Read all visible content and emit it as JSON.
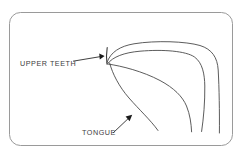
{
  "figure": {
    "background_color": "#ffffff",
    "frame": {
      "name": "rounded-rectangle-border",
      "stroke_color": "#9a9a9a",
      "fill_color": "#ffffff",
      "x": 9,
      "y": 12,
      "width": 224,
      "height": 134,
      "corner_radius": 11
    },
    "line_color": "#4a4a4a",
    "labels": [
      {
        "id": "upper-teeth",
        "text": "UPPER TEETH",
        "text_x": 20,
        "text_y": 66,
        "arrow": {
          "from_x": 73,
          "from_y": 61,
          "to_x": 104,
          "to_y": 56,
          "head_direction": "right"
        }
      },
      {
        "id": "tongue",
        "text": "TONGUE",
        "text_x": 82,
        "text_y": 135,
        "arrow": {
          "from_x": 113,
          "from_y": 133,
          "to_x": 132,
          "to_y": 115,
          "head_direction": "up-right"
        }
      }
    ],
    "strokes": [
      {
        "id": "upper-teeth-stroke",
        "name": "upper-teeth",
        "path": "M 107.2 47.5 C 106.4 52.5 106.3 58.5 107.0 64.2"
      },
      {
        "id": "hard-palate-outer",
        "name": "palate-outer-contour",
        "path": "M 107.0 62.5 C 110.5 52.0 120.0 46.2 134.0 43.8 C 156.0 40.2 186.0 41.4 200.0 45.5 C 212.0 49.2 217.4 57.5 218.2 70.0 C 219.2 88.0 219.6 112.0 219.4 133.0"
      },
      {
        "id": "hard-palate-inner",
        "name": "palate-inner-contour",
        "path": "M 107.6 63.6 C 113.0 56.8 124.0 52.6 140.0 51.2 C 163.0 49.2 186.0 51.0 194.5 57.0 C 202.5 62.8 204.6 74.0 204.8 86.0 C 205.0 102.0 203.6 118.0 201.6 131.5"
      },
      {
        "id": "tongue-dorsum",
        "name": "tongue-upper-contour",
        "path": "M 107.8 64.0 C 122.0 66.0 143.0 71.5 160.0 80.5 C 174.0 88.0 182.5 96.5 186.5 106.0 C 190.0 114.5 191.2 123.5 191.6 131.8"
      },
      {
        "id": "tongue-underside",
        "name": "tongue-lower-contour",
        "path": "M 109.6 63.0 C 112.6 74.0 119.0 86.5 129.0 98.0 C 139.5 110.0 150.5 120.0 158.0 130.5"
      }
    ]
  }
}
